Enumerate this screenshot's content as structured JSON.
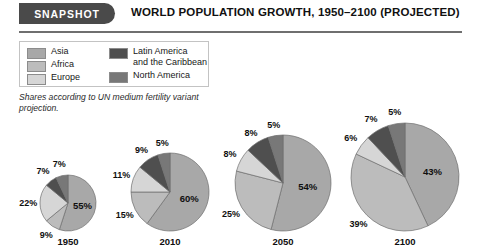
{
  "header": {
    "badge": "SNAPSHOT",
    "title": "WORLD POPULATION GROWTH, 1950–2100 (PROJECTED)"
  },
  "legend": {
    "items": [
      {
        "label": "Asia",
        "color": "#a8a8a8"
      },
      {
        "label": "Africa",
        "color": "#bcbcbc"
      },
      {
        "label": "Europe",
        "color": "#d6d6d6"
      },
      {
        "label": "Latin America\nand the Caribbean",
        "color": "#4f4f4f"
      },
      {
        "label": "North America",
        "color": "#787878"
      }
    ]
  },
  "note": "Shares according to UN medium fertility variant projection.",
  "chart_data": {
    "type": "pie",
    "title": "WORLD POPULATION GROWTH, 1950–2100 (PROJECTED)",
    "note": "Shares according to UN medium fertility variant projection.",
    "unit": "percent",
    "categories": [
      "Asia",
      "Africa",
      "Europe",
      "Latin America and the Caribbean",
      "North America"
    ],
    "colors": [
      "#a8a8a8",
      "#bcbcbc",
      "#d6d6d6",
      "#4f4f4f",
      "#787878"
    ],
    "legend_position": "top-left",
    "grid": false,
    "charts": [
      {
        "year": "1950",
        "radius_px": 28,
        "values": [
          55,
          9,
          22,
          7,
          7
        ],
        "labels": [
          "55%",
          "9%",
          "22%",
          "7%",
          "7%"
        ]
      },
      {
        "year": "2010",
        "radius_px": 39,
        "values": [
          60,
          15,
          11,
          9,
          5
        ],
        "labels": [
          "60%",
          "15%",
          "11%",
          "9%",
          "5%"
        ]
      },
      {
        "year": "2050",
        "radius_px": 48,
        "values": [
          54,
          25,
          8,
          8,
          5
        ],
        "labels": [
          "54%",
          "25%",
          "8%",
          "8%",
          "5%"
        ]
      },
      {
        "year": "2100",
        "radius_px": 54,
        "values": [
          43,
          39,
          6,
          7,
          5
        ],
        "labels": [
          "43%",
          "39%",
          "6%",
          "7%",
          "5%"
        ]
      }
    ]
  },
  "layout": {
    "charts": [
      {
        "cx": 68,
        "cy": 203,
        "year_y": 236
      },
      {
        "cx": 170,
        "cy": 192,
        "year_y": 236
      },
      {
        "cx": 283,
        "cy": 183,
        "year_y": 236
      },
      {
        "cx": 405,
        "cy": 177,
        "year_y": 236
      }
    ],
    "label_offsets": [
      [
        {
          "a": 0.6,
          "r": 0.52
        },
        {
          "a": 0.18,
          "r": 1.38
        },
        {
          "a": 0.32,
          "r": 1.42
        },
        {
          "a": 0.22,
          "r": 1.45
        },
        {
          "a": 0.2,
          "r": 1.42
        }
      ],
      [
        {
          "a": 0.6,
          "r": 0.52
        },
        {
          "a": 0.18,
          "r": 1.3
        },
        {
          "a": 0.28,
          "r": 1.32
        },
        {
          "a": 0.22,
          "r": 1.3
        },
        {
          "a": 0.2,
          "r": 1.28
        }
      ],
      [
        {
          "a": 0.6,
          "r": 0.52
        },
        {
          "a": 0.2,
          "r": 1.26
        },
        {
          "a": 0.3,
          "r": 1.26
        },
        {
          "a": 0.22,
          "r": 1.24
        },
        {
          "a": 0.2,
          "r": 1.22
        }
      ],
      [
        {
          "a": 0.62,
          "r": 0.52
        },
        {
          "a": 0.22,
          "r": 1.22
        },
        {
          "a": 0.32,
          "r": 1.24
        },
        {
          "a": 0.24,
          "r": 1.24
        },
        {
          "a": 0.2,
          "r": 1.22
        }
      ]
    ]
  }
}
